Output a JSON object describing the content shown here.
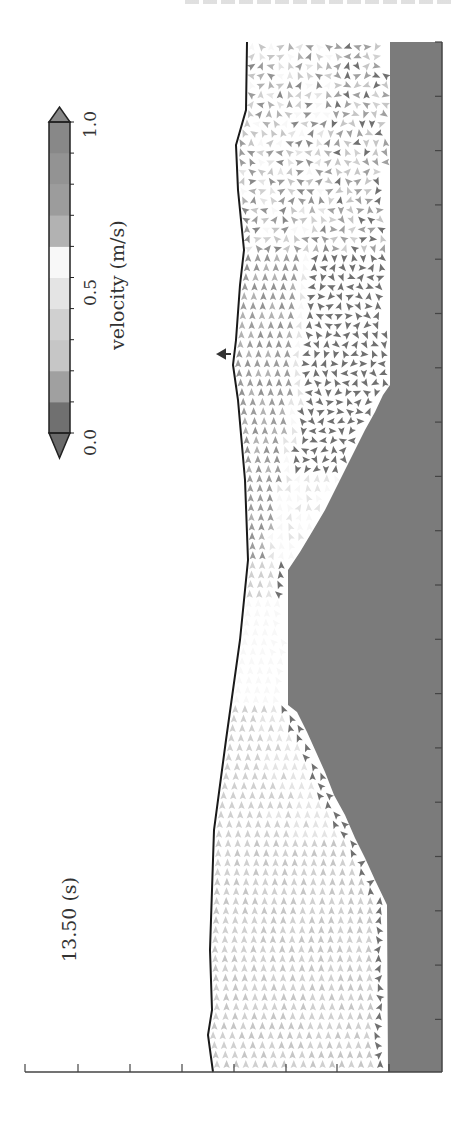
{
  "page_header": {
    "text": ""
  },
  "figure": {
    "time_label": "13.50 (s)",
    "colorbar": {
      "label": "velocity (m/s)",
      "ticks": [
        "0.0",
        "0.5",
        "1.0"
      ],
      "min": 0.0,
      "max": 1.0,
      "bins": [
        {
          "from": 0.0,
          "to": 0.1,
          "color": "#707070"
        },
        {
          "from": 0.1,
          "to": 0.2,
          "color": "#a0a0a0"
        },
        {
          "from": 0.2,
          "to": 0.3,
          "color": "#c6c6c6"
        },
        {
          "from": 0.3,
          "to": 0.4,
          "color": "#d0d0d0"
        },
        {
          "from": 0.4,
          "to": 0.5,
          "color": "#e4e4e4"
        },
        {
          "from": 0.5,
          "to": 0.6,
          "color": "#f8f8f8"
        },
        {
          "from": 0.6,
          "to": 0.7,
          "color": "#b2b2b2"
        },
        {
          "from": 0.7,
          "to": 0.8,
          "color": "#9c9c9c"
        },
        {
          "from": 0.8,
          "to": 0.9,
          "color": "#939393"
        },
        {
          "from": 0.9,
          "to": 1.0,
          "color": "#888888"
        }
      ],
      "under_color": "#6a6a6a",
      "over_color": "#888888"
    },
    "colors": {
      "bed": "#7b7b7b",
      "free_surface": "#1a1a1a",
      "axis": "#444444"
    }
  },
  "chart_data": {
    "type": "vector-field",
    "title": "13.50 (s)",
    "orientation": "rotated 90° counter-clockwise (channel flows toward top of page)",
    "xlabel": "",
    "ylabel": "",
    "colorbar_label": "velocity (m/s)",
    "colorbar_range": [
      0.0,
      1.0
    ],
    "colorbar_ticks": [
      0.0,
      0.5,
      1.0
    ],
    "x_ticks_count": 8,
    "tick_labels_visible": false,
    "free_surface_px": [
      [
        247,
        42
      ],
      [
        246,
        110
      ],
      [
        236,
        145
      ],
      [
        238,
        190
      ],
      [
        244,
        250
      ],
      [
        240,
        285
      ],
      [
        236,
        340
      ],
      [
        233,
        365
      ],
      [
        238,
        400
      ],
      [
        245,
        480
      ],
      [
        248,
        560
      ],
      [
        240,
        640
      ],
      [
        226,
        740
      ],
      [
        214,
        830
      ],
      [
        210,
        950
      ],
      [
        212,
        1010
      ],
      [
        208,
        1035
      ],
      [
        213,
        1072
      ]
    ],
    "bed_profile_px": [
      [
        390,
        42
      ],
      [
        390,
        385
      ],
      [
        383,
        395
      ],
      [
        375,
        412
      ],
      [
        365,
        430
      ],
      [
        355,
        450
      ],
      [
        345,
        470
      ],
      [
        335,
        490
      ],
      [
        325,
        510
      ],
      [
        312,
        532
      ],
      [
        300,
        552
      ],
      [
        288,
        570
      ],
      [
        288,
        705
      ],
      [
        297,
        712
      ],
      [
        307,
        732
      ],
      [
        316,
        752
      ],
      [
        325,
        772
      ],
      [
        334,
        795
      ],
      [
        345,
        815
      ],
      [
        355,
        838
      ],
      [
        365,
        858
      ],
      [
        375,
        880
      ],
      [
        387,
        905
      ],
      [
        388,
        1072
      ]
    ],
    "regions": [
      {
        "name": "upstream uniform flow",
        "y_range_px": [
          840,
          1072
        ],
        "speed_ms": 0.3,
        "direction": "downstream"
      },
      {
        "name": "flow over slope",
        "y_range_px": [
          560,
          840
        ],
        "speed_ms": 0.4,
        "direction": "downstream"
      },
      {
        "name": "accelerated flow over crest",
        "y_range_px": [
          250,
          560
        ],
        "speed_ms": 0.8,
        "direction": "downstream"
      },
      {
        "name": "recirculation eddy in lee",
        "y_range_px": [
          160,
          470
        ],
        "speed_ms": 0.05,
        "direction": "rotating"
      },
      {
        "name": "turbulent wake",
        "y_range_px": [
          42,
          250
        ],
        "speed_ms": 0.5,
        "direction": "mixed"
      }
    ],
    "gauge_marker_px": [
      224,
      354
    ]
  }
}
